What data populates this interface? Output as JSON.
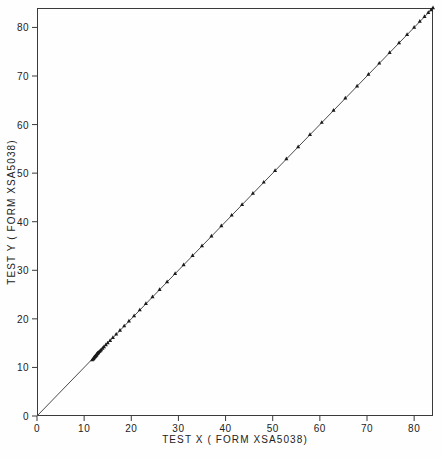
{
  "chart_data": {
    "type": "scatter",
    "title": "",
    "xlabel": "TEST X ( FORM XSA5038)",
    "ylabel": "TEST Y ( FORM XSA5038)",
    "xlim": [
      0,
      84
    ],
    "ylim": [
      0,
      84
    ],
    "xticks": [
      0,
      10,
      20,
      30,
      40,
      50,
      60,
      70,
      80
    ],
    "yticks": [
      0,
      10,
      20,
      30,
      40,
      50,
      60,
      70,
      80
    ],
    "xticklabels": [
      "0",
      "10",
      "20",
      "30",
      "40",
      "50",
      "60",
      "70",
      "80"
    ],
    "yticklabels": [
      "0",
      "10",
      "20",
      "30",
      "40",
      "50",
      "60",
      "70",
      "80"
    ],
    "grid": false,
    "legend": null,
    "marker": "filled-triangle",
    "marker_color": "#1a1a1a",
    "line_color": "#4a4a4a",
    "frame_color": "#3a3a3a",
    "reference_line": {
      "label": "identity line",
      "x": [
        0,
        84
      ],
      "y": [
        0,
        84
      ]
    },
    "series": [
      {
        "name": "TEST Y vs TEST X",
        "points": [
          [
            11.7,
            11.6
          ],
          [
            11.9,
            11.8
          ],
          [
            12.0,
            11.9
          ],
          [
            12.1,
            12.1
          ],
          [
            12.2,
            12.2
          ],
          [
            12.3,
            12.3
          ],
          [
            12.4,
            12.4
          ],
          [
            12.5,
            12.5
          ],
          [
            12.6,
            12.6
          ],
          [
            12.7,
            12.8
          ],
          [
            12.8,
            12.9
          ],
          [
            12.9,
            13.0
          ],
          [
            13.0,
            13.1
          ],
          [
            13.2,
            13.3
          ],
          [
            13.4,
            13.5
          ],
          [
            13.6,
            13.7
          ],
          [
            13.9,
            14.0
          ],
          [
            14.2,
            14.3
          ],
          [
            14.6,
            14.7
          ],
          [
            15.0,
            15.1
          ],
          [
            15.5,
            15.6
          ],
          [
            16.1,
            16.2
          ],
          [
            16.8,
            16.9
          ],
          [
            17.6,
            17.7
          ],
          [
            18.5,
            18.6
          ],
          [
            19.5,
            19.6
          ],
          [
            20.6,
            20.7
          ],
          [
            21.8,
            21.9
          ],
          [
            23.1,
            23.2
          ],
          [
            24.5,
            24.6
          ],
          [
            26.0,
            26.1
          ],
          [
            27.6,
            27.7
          ],
          [
            29.3,
            29.4
          ],
          [
            31.1,
            31.2
          ],
          [
            33.0,
            33.1
          ],
          [
            35.0,
            35.1
          ],
          [
            37.0,
            37.1
          ],
          [
            39.1,
            39.2
          ],
          [
            41.3,
            41.4
          ],
          [
            43.5,
            43.6
          ],
          [
            45.8,
            45.9
          ],
          [
            48.1,
            48.2
          ],
          [
            50.5,
            50.6
          ],
          [
            52.9,
            53.0
          ],
          [
            55.4,
            55.5
          ],
          [
            57.9,
            58.0
          ],
          [
            60.4,
            60.5
          ],
          [
            62.9,
            63.0
          ],
          [
            65.4,
            65.5
          ],
          [
            67.9,
            68.0
          ],
          [
            70.3,
            70.4
          ],
          [
            72.6,
            72.7
          ],
          [
            74.8,
            74.9
          ],
          [
            76.8,
            76.9
          ],
          [
            78.5,
            78.6
          ],
          [
            80.0,
            80.1
          ],
          [
            81.2,
            81.3
          ],
          [
            82.2,
            82.3
          ],
          [
            83.0,
            83.1
          ],
          [
            83.6,
            83.7
          ],
          [
            84.0,
            84.1
          ]
        ]
      }
    ]
  }
}
